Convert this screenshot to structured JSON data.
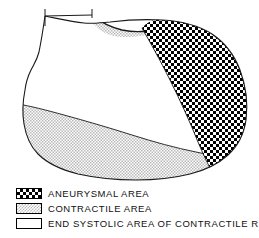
{
  "figure": {
    "line_color": "#1a1a1a",
    "fill_color": "#ffffff",
    "regions": [
      {
        "name": "aneurysmal-region",
        "pattern": "checkerboard",
        "pattern_color": "#000000",
        "location": "right"
      },
      {
        "name": "contractile-region",
        "pattern": "stipple",
        "pattern_color": "#b9b9b9",
        "location": "bottom-left-band"
      },
      {
        "name": "contractile-region-top-crescent",
        "pattern": "stipple",
        "pattern_color": "#b9b9b9",
        "location": "top-crescent"
      },
      {
        "name": "end-systolic-region",
        "pattern": "blank",
        "pattern_color": "#ffffff",
        "location": "center-left"
      }
    ],
    "valve_plane": {
      "name": "valve-plane-line",
      "visible": true
    }
  },
  "legend": {
    "items": [
      {
        "swatch": "checkerboard",
        "label": "ANEURYSMAL   AREA"
      },
      {
        "swatch": "stipple",
        "label": "CONTRACTILE   AREA"
      },
      {
        "swatch": "blank",
        "label": "END SYSTOLIC AREA OF CONTRACTILE REGION"
      }
    ]
  }
}
